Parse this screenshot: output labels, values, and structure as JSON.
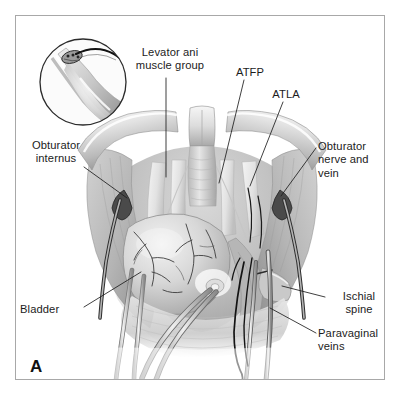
{
  "figure": {
    "panel_letter": "A",
    "frame_border_color": "#a8a8a8",
    "background_color": "#ffffff",
    "ink_color": "#1c1c1c",
    "title": "",
    "type": "medical-anatomical-illustration",
    "style": "grayscale line-and-tone drawing"
  },
  "labels": {
    "levator_ani": "Levator ani\nmuscle group",
    "atfp": "ATFP",
    "atla": "ATLA",
    "obturator_internus": "Obturator\ninternus",
    "obturator_nerve_and_vein": "Obturator\nnerve and\nvein",
    "bladder": "Bladder",
    "ischial_spine": "Ischial\nspine",
    "paravaginal_veins": "Paravaginal\nveins"
  },
  "leader_lines": [
    {
      "name": "levator-ani-leader",
      "x1": 166,
      "y1": 78,
      "x2": 166,
      "y2": 177
    },
    {
      "name": "atfp-leader",
      "x1": 244,
      "y1": 80,
      "x2": 219,
      "y2": 183
    },
    {
      "name": "atla-leader",
      "x1": 283,
      "y1": 102,
      "x2": 250,
      "y2": 186
    },
    {
      "name": "obturator-internus-leader",
      "x1": 84,
      "y1": 167,
      "x2": 127,
      "y2": 198
    },
    {
      "name": "obturator-nerve-leader",
      "x1": 316,
      "y1": 148,
      "x2": 281,
      "y2": 196
    },
    {
      "name": "bladder-leader",
      "x1": 84,
      "y1": 307,
      "x2": 141,
      "y2": 272
    },
    {
      "name": "ischial-spine-leader",
      "x1": 325,
      "y1": 297,
      "x2": 282,
      "y2": 286
    },
    {
      "name": "paravaginal-veins-leader",
      "x1": 316,
      "y1": 333,
      "x2": 270,
      "y2": 308
    }
  ],
  "inset": {
    "name": "detail-inset",
    "description": "Circular magnified detail of curved needle passing beside tissue fold",
    "center_x": 83,
    "center_y": 82,
    "radius": 44
  },
  "anatomy_parts": [
    "pubic-symphysis",
    "pubic-rami",
    "levator-ani-muscle",
    "obturator-internus-muscle",
    "urethra",
    "bladder",
    "vaginal-wall",
    "arcus-tendineus-fasciae-pelvis",
    "arcus-tendineus-levator-ani",
    "ischial-spine",
    "paravaginal-veins",
    "obturator-neurovascular-bundle",
    "sling-tape"
  ]
}
